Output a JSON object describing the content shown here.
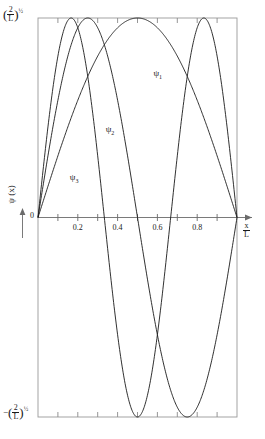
{
  "chart_data": {
    "type": "line",
    "title": "",
    "subtitle": "",
    "xlabel": "x/L",
    "ylabel": "psi(x)",
    "xlim": [
      0,
      1
    ],
    "ylim": [
      -1,
      1
    ],
    "grid": false,
    "legend_position": "inline-annotations",
    "x_tick_labels": [
      "0.2",
      "0.4",
      "0.6",
      "0.8"
    ],
    "x_tick_values": [
      0.2,
      0.4,
      0.6,
      0.8
    ],
    "x_minor_tick_values": [
      0.1,
      0.3,
      0.5,
      0.7,
      0.9
    ],
    "y_tick_labels": [
      "(2/L)^1/2",
      "0",
      "-(2/L)^1/2"
    ],
    "y_tick_values": [
      1,
      0,
      -1
    ],
    "origin_label": "0",
    "series": [
      {
        "name": "psi_1",
        "label": "ψ",
        "subscript": "1",
        "formula": "sin(pi*x)",
        "n": 1,
        "nodes": [
          0,
          1
        ],
        "extrema": [
          {
            "x": 0.5,
            "y": 1
          }
        ],
        "label_x": 0.6,
        "label_y": 0.72
      },
      {
        "name": "psi_2",
        "label": "ψ",
        "subscript": "2",
        "formula": "sin(2*pi*x)",
        "n": 2,
        "nodes": [
          0,
          0.5,
          1
        ],
        "extrema": [
          {
            "x": 0.25,
            "y": 1
          },
          {
            "x": 0.75,
            "y": -1
          }
        ],
        "label_x": 0.36,
        "label_y": 0.44
      },
      {
        "name": "psi_3",
        "label": "ψ",
        "subscript": "3",
        "formula": "sin(3*pi*x)",
        "n": 3,
        "nodes": [
          0,
          0.3333,
          0.6667,
          1
        ],
        "extrema": [
          {
            "x": 0.1667,
            "y": 1
          },
          {
            "x": 0.5,
            "y": -1
          },
          {
            "x": 0.8333,
            "y": 1
          }
        ],
        "label_x": 0.18,
        "label_y": 0.2
      }
    ],
    "axis_labels": {
      "y_top": {
        "prefix": "",
        "numerator": "2",
        "denominator": "L",
        "exponent": "1/2"
      },
      "y_bottom": {
        "prefix": "−",
        "numerator": "2",
        "denominator": "L",
        "exponent": "1/2"
      },
      "x_axis": {
        "numerator": "x",
        "denominator": "L"
      },
      "y_axis": "ψ (x)"
    },
    "colors": {
      "curve": "#1a1a1a",
      "frame": "#8a8a8a",
      "axis": "#6b6b6b",
      "background": "#ffffff",
      "text": "#1a1a1a"
    }
  }
}
